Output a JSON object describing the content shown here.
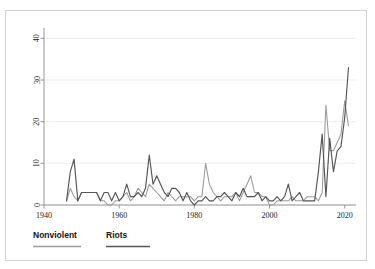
{
  "figure": {
    "top_stub_text": "",
    "frame_color": "#d2d2d2",
    "background": "#ffffff"
  },
  "legend": {
    "position": "bottom-left",
    "items": [
      {
        "label": "Nonviolent",
        "color": "#9a9a9a"
      },
      {
        "label": "Riots",
        "color": "#555555"
      }
    ]
  },
  "chart_data": {
    "type": "line",
    "title": "",
    "subtitle": "",
    "xlabel": "",
    "ylabel": "",
    "xlim": [
      1940,
      2023
    ],
    "ylim": [
      0,
      42
    ],
    "xticks": [
      1940,
      1960,
      1980,
      2000,
      2020
    ],
    "xticklabels": [
      "1940",
      "1960",
      "1980",
      "2000",
      "2020"
    ],
    "yticks": [
      0,
      10,
      20,
      30,
      40
    ],
    "yticklabels": [
      "0",
      "10",
      "20",
      "30",
      "40"
    ],
    "grid": "horizontal",
    "legend_position": "below-axes-left",
    "x": [
      1946,
      1947,
      1948,
      1949,
      1950,
      1951,
      1952,
      1953,
      1954,
      1955,
      1956,
      1957,
      1958,
      1959,
      1960,
      1961,
      1962,
      1963,
      1964,
      1965,
      1966,
      1967,
      1968,
      1969,
      1970,
      1971,
      1972,
      1973,
      1974,
      1975,
      1976,
      1977,
      1978,
      1979,
      1980,
      1981,
      1982,
      1983,
      1984,
      1985,
      1986,
      1987,
      1988,
      1989,
      1990,
      1991,
      1992,
      1993,
      1994,
      1995,
      1996,
      1997,
      1998,
      1999,
      2000,
      2001,
      2002,
      2003,
      2004,
      2005,
      2006,
      2007,
      2008,
      2009,
      2010,
      2011,
      2012,
      2013,
      2014,
      2015,
      2016,
      2017,
      2018,
      2019,
      2020,
      2021
    ],
    "series": [
      {
        "name": "Nonviolent",
        "color": "#9a9a9a",
        "values": [
          1,
          4,
          2,
          1,
          3,
          3,
          3,
          3,
          3,
          1,
          1,
          0,
          0,
          1,
          1,
          2,
          3,
          1,
          2,
          4,
          3,
          2,
          5,
          4,
          3,
          2,
          1,
          3,
          2,
          1,
          2,
          2,
          2,
          2,
          1,
          2,
          2,
          10,
          5,
          3,
          2,
          1,
          2,
          2,
          2,
          3,
          1,
          3,
          5,
          7,
          3,
          3,
          2,
          2,
          0,
          0,
          1,
          1,
          1,
          1,
          2,
          1,
          1,
          1,
          2,
          2,
          2,
          1,
          3,
          24,
          13,
          13,
          15,
          17,
          25,
          19
        ]
      },
      {
        "name": "Riots",
        "color": "#555555",
        "values": [
          1,
          8,
          11,
          1,
          3,
          3,
          3,
          3,
          3,
          1,
          3,
          3,
          1,
          3,
          1,
          2,
          5,
          2,
          2,
          3,
          2,
          4,
          12,
          5,
          7,
          5,
          3,
          2,
          4,
          4,
          3,
          1,
          3,
          1,
          0,
          1,
          1,
          2,
          1,
          1,
          2,
          2,
          3,
          2,
          1,
          3,
          2,
          4,
          2,
          2,
          2,
          3,
          1,
          2,
          1,
          1,
          2,
          1,
          2,
          5,
          1,
          2,
          3,
          1,
          1,
          1,
          1,
          8,
          17,
          2,
          16,
          8,
          13,
          14,
          21,
          33
        ]
      }
    ]
  }
}
